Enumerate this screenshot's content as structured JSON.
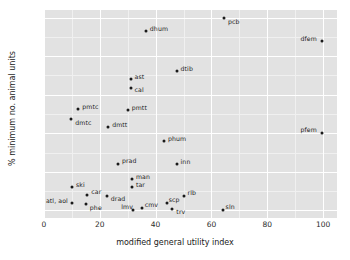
{
  "chart_data": {
    "type": "scatter",
    "title": "",
    "xlabel": "modified general utility index",
    "ylabel": "% minimum no. animal units",
    "xlim": [
      0,
      105
    ],
    "ylim": [
      -4,
      104
    ],
    "xticks": [
      0,
      20,
      40,
      60,
      80,
      100
    ],
    "yticks": [
      0,
      20,
      40,
      60,
      80,
      100
    ],
    "grid": true,
    "legend": "none",
    "points": [
      {
        "label": "pcb",
        "x": 64.5,
        "y": 100.0,
        "lx": 4,
        "ly": 1
      },
      {
        "label": "dfem",
        "x": 99.8,
        "y": 88.0,
        "lx": -22,
        "ly": -5
      },
      {
        "label": "dhum",
        "x": 36.5,
        "y": 93.0,
        "lx": 4,
        "ly": -5
      },
      {
        "label": "dtib",
        "x": 47.5,
        "y": 72.5,
        "lx": 4,
        "ly": -5
      },
      {
        "label": "ast",
        "x": 31.0,
        "y": 68.0,
        "lx": 4,
        "ly": -5
      },
      {
        "label": "cal",
        "x": 31.0,
        "y": 63.5,
        "lx": 4,
        "ly": -1
      },
      {
        "label": "pmtc",
        "x": 12.3,
        "y": 52.5,
        "lx": 4,
        "ly": -5
      },
      {
        "label": "pmtt",
        "x": 30.0,
        "y": 52.0,
        "lx": 4,
        "ly": -5
      },
      {
        "label": "dmtc",
        "x": 9.8,
        "y": 47.5,
        "lx": 4,
        "ly": 1
      },
      {
        "label": "dmtt",
        "x": 23.0,
        "y": 43.5,
        "lx": 4,
        "ly": -5
      },
      {
        "label": "pfem",
        "x": 99.8,
        "y": 40.0,
        "lx": -22,
        "ly": -6
      },
      {
        "label": "phum",
        "x": 43.0,
        "y": 36.0,
        "lx": 4,
        "ly": -5
      },
      {
        "label": "prad",
        "x": 26.5,
        "y": 24.0,
        "lx": 4,
        "ly": -6
      },
      {
        "label": "inn",
        "x": 47.5,
        "y": 23.8,
        "lx": 4,
        "ly": -5
      },
      {
        "label": "man",
        "x": 31.5,
        "y": 16.2,
        "lx": 4,
        "ly": -5
      },
      {
        "label": "tar",
        "x": 31.5,
        "y": 12.0,
        "lx": 4,
        "ly": -5
      },
      {
        "label": "ski",
        "x": 10.0,
        "y": 12.3,
        "lx": 4,
        "ly": -5
      },
      {
        "label": "car",
        "x": 15.5,
        "y": 8.0,
        "lx": 4,
        "ly": -6
      },
      {
        "label": "drad",
        "x": 22.5,
        "y": 7.5,
        "lx": 4,
        "ly": 0
      },
      {
        "label": "rlb",
        "x": 50.0,
        "y": 7.5,
        "lx": 4,
        "ly": -6
      },
      {
        "label": "scp",
        "x": 44.0,
        "y": 4.0,
        "lx": 2,
        "ly": -6
      },
      {
        "label": "phe",
        "x": 15.0,
        "y": 3.5,
        "lx": 4,
        "ly": 1
      },
      {
        "label": "atl, aol",
        "x": 10.0,
        "y": 4.0,
        "lx": -26,
        "ly": -5
      },
      {
        "label": "trv",
        "x": 46.0,
        "y": 0.5,
        "lx": 4,
        "ly": 0
      },
      {
        "label": "cmv",
        "x": 35.0,
        "y": 1.0,
        "lx": 3,
        "ly": -6
      },
      {
        "label": "lmv",
        "x": 32.0,
        "y": 0.2,
        "lx": -12,
        "ly": -6
      },
      {
        "label": "sln",
        "x": 64.0,
        "y": 0.2,
        "lx": 3,
        "ly": -6
      }
    ]
  },
  "axes": {
    "x_tick_labels": [
      "0",
      "20",
      "40",
      "60",
      "80",
      "100"
    ],
    "y_tick_labels": [
      "0",
      "20",
      "40",
      "60",
      "80",
      "100"
    ],
    "x_axis_title": "modified general utility index",
    "y_axis_title": "% minimum no. animal units"
  }
}
